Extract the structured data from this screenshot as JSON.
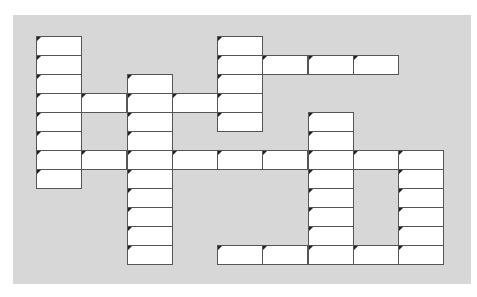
{
  "puzzle": {
    "type": "crossword-grid",
    "grid": {
      "origin_x": 37,
      "origin_y": 37,
      "cell_w": 45.25,
      "cell_h": 19,
      "cols": 9,
      "rows": 12
    },
    "colors": {
      "background": "#ffffff",
      "panel": "#d7d7d7",
      "cell": "#ffffff",
      "border": "#555555",
      "marker": "#222222"
    },
    "words": [
      {
        "id": "down-1",
        "dir": "down",
        "col": 0,
        "row": 0,
        "len": 8
      },
      {
        "id": "down-2",
        "dir": "down",
        "col": 2,
        "row": 2,
        "len": 10
      },
      {
        "id": "down-3",
        "dir": "down",
        "col": 4,
        "row": 0,
        "len": 5
      },
      {
        "id": "down-4",
        "dir": "down",
        "col": 6,
        "row": 4,
        "len": 8
      },
      {
        "id": "down-5",
        "dir": "down",
        "col": 8,
        "row": 6,
        "len": 6
      },
      {
        "id": "across-1",
        "dir": "across",
        "col": 4,
        "row": 1,
        "len": 4
      },
      {
        "id": "across-2",
        "dir": "across",
        "col": 0,
        "row": 3,
        "len": 5
      },
      {
        "id": "across-3",
        "dir": "across",
        "col": 0,
        "row": 6,
        "len": 9
      },
      {
        "id": "across-4",
        "dir": "across",
        "col": 4,
        "row": 11,
        "len": 5
      }
    ]
  }
}
